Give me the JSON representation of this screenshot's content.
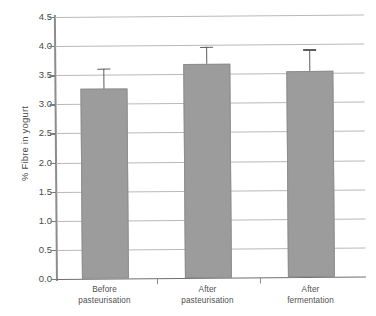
{
  "chart_data": {
    "type": "bar",
    "title": "",
    "xlabel": "",
    "ylabel": "% Fibre in yogurt",
    "categories": [
      "Before pasteurisation",
      "After pasteurisation",
      "After fermentation"
    ],
    "category_lines": [
      [
        "Before",
        "pasteurisation"
      ],
      [
        "After",
        "pasteurisation"
      ],
      [
        "After",
        "fermentation"
      ]
    ],
    "values": [
      3.26,
      3.68,
      3.53
    ],
    "errors": [
      0.35,
      0.29,
      0.38
    ],
    "ylim": [
      0.0,
      4.5
    ],
    "ytick_values": [
      0.0,
      0.5,
      1.0,
      1.5,
      2.0,
      2.5,
      3.0,
      3.5,
      4.0,
      4.5
    ],
    "ytick_labels": [
      "0.0",
      "0.5",
      "1.0",
      "1.5",
      "2.0",
      "2.5",
      "3.0",
      "3.5",
      "4.0",
      "4.5"
    ],
    "grid": true,
    "legend": false,
    "legend_position": "none",
    "bar_color": "#9c9c9c",
    "grid_color": "#b9b9b9",
    "axis_color": "#8d8d8d",
    "error_bar_color": "#5c5c5c",
    "error_bar_type": "symmetric-upper"
  }
}
